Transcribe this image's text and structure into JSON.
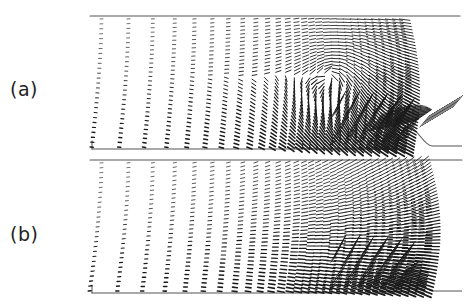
{
  "figure": {
    "panels": [
      {
        "id": "a",
        "label": "(a)",
        "label_x": 10,
        "label_y": 78
      },
      {
        "id": "b",
        "label": "(b)",
        "label_x": 10,
        "label_y": 223
      }
    ]
  },
  "chart_data": {
    "type": "quiver",
    "title": "",
    "axes": {
      "visible": false,
      "grid": false
    },
    "colors": {
      "vectors": "#1a1a1a",
      "walls": "#555555",
      "background": "#ffffff"
    },
    "panels": [
      {
        "label": "(a)",
        "top_wall": {
          "x0": 90,
          "x1": 460,
          "y": 16
        },
        "bottom_wall": {
          "x0": 92,
          "x1": 392,
          "y": 149
        },
        "bump": {
          "start_x": 392,
          "peak_x": 408,
          "end_x": 432,
          "base_y": 149,
          "peak_y": 126,
          "outlet_x": 462,
          "outlet_y": 146
        },
        "field_right_edge": 405,
        "features": "strong recirculating vortex upstream of bump, intense jet crossing bump toward upper right",
        "jet": true
      },
      {
        "label": "(b)",
        "top_wall": {
          "x0": 90,
          "x1": 462,
          "y": 160
        },
        "bottom_wall": {
          "x0": 92,
          "x1": 392,
          "y": 293
        },
        "bump": {
          "start_x": 392,
          "peak_x": 408,
          "end_x": 432,
          "base_y": 293,
          "peak_y": 270,
          "outlet_x": 462,
          "outlet_y": 291
        },
        "field_right_edge": 425,
        "features": "smooth curved flow toward bump, dense near-bump region, no jet",
        "jet": false
      }
    ]
  }
}
